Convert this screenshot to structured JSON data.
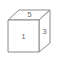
{
  "figure": {
    "type": "line-drawing",
    "projection": "oblique",
    "background_color": "#ffffff",
    "stroke_color": "#8a8a8a",
    "label_color": "#6e6e6e",
    "faces": [
      {
        "id": "top",
        "name": "top-face",
        "label": "5",
        "label_x": 29.5,
        "label_y": 14.5,
        "points": "8,20 19,10 50,10 39,20"
      },
      {
        "id": "front",
        "name": "front-face",
        "label": "1",
        "label_x": 23.5,
        "label_y": 37,
        "points": "8,20 39,20 39,52 8,52"
      },
      {
        "id": "right",
        "name": "right-face",
        "label": "3",
        "label_x": 44.5,
        "label_y": 31.5,
        "points": "39,20 50,10 50,43 39,52"
      }
    ]
  }
}
